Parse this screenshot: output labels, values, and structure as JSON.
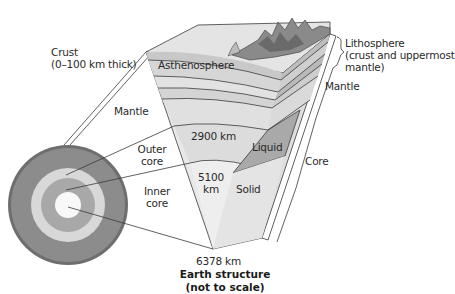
{
  "diagram": {
    "title_line1": "Earth structure",
    "title_line2": "(not to scale)",
    "labels": {
      "crust_line1": "Crust",
      "crust_line2": "(0–100 km thick)",
      "mantle_left": "Mantle",
      "outer_core_line1": "Outer",
      "outer_core_line2": "core",
      "inner_core_line1": "Inner",
      "inner_core_line2": "core",
      "asthenosphere": "Asthenosphere",
      "depth_2900": "2900 km",
      "depth_5100_line1": "5100",
      "depth_5100_line2": "km",
      "depth_6378": "6378 km",
      "liquid": "Liquid",
      "solid": "Solid",
      "lithosphere_line1": "Lithosphere",
      "lithosphere_line2": "(crust and uppermost",
      "lithosphere_line3": "mantle)",
      "mantle_right": "Mantle",
      "core_right": "Core"
    },
    "colors": {
      "crust_ring": "#6e6e6e",
      "mantle": "#8c8c8c",
      "outer_core_ring": "#d8d8d8",
      "inner_ring": "#a8a8a8",
      "inner_core": "#f8f8f8",
      "wedge_light": "#e6e6e6",
      "wedge_mid": "#d0d0d0",
      "liquid": "#a9a9a9",
      "line": "#3a3a3a"
    }
  }
}
